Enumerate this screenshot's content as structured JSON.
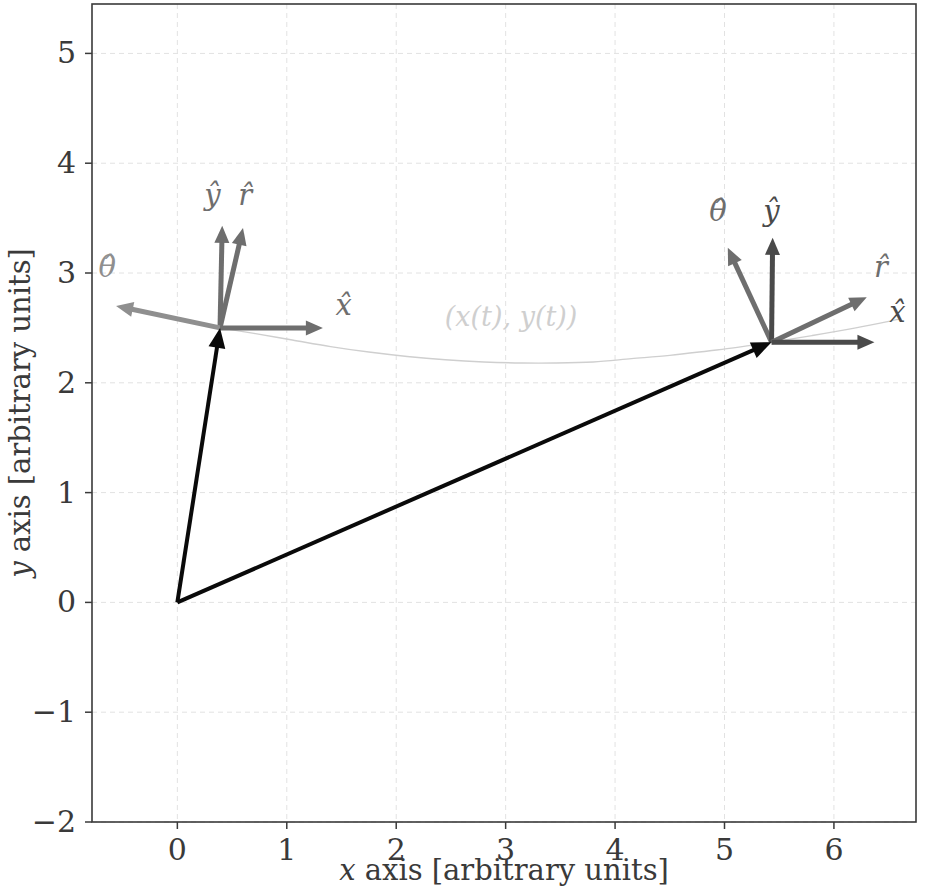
{
  "figure": {
    "background_color": "#ffffff",
    "frame_color": "#3a3a3a",
    "grid_color": "#e2e2e2",
    "tick_label_color": "#3a3a3a"
  },
  "axes": {
    "xlabel": "x axis [arbitrary units]",
    "xlabel_var": "x",
    "xlabel_rest": " axis [arbitrary units]",
    "ylabel": "y axis [arbitrary units]",
    "ylabel_var": "y",
    "ylabel_rest": " axis [arbitrary units]",
    "xlim": [
      -0.78,
      6.75
    ],
    "ylim": [
      -2.0,
      5.45
    ],
    "xticks": [
      0,
      1,
      2,
      3,
      4,
      5,
      6
    ],
    "xticklabels": [
      "0",
      "1",
      "2",
      "3",
      "4",
      "5",
      "6"
    ],
    "yticks": [
      -2,
      -1,
      0,
      1,
      2,
      3,
      4,
      5
    ],
    "yticklabels": [
      "−2",
      "−1",
      "0",
      "1",
      "2",
      "3",
      "4",
      "5"
    ],
    "grid": true
  },
  "chart_data": {
    "type": "scatter",
    "title": "",
    "xlabel": "x axis [arbitrary units]",
    "ylabel": "y axis [arbitrary units]",
    "xlim": [
      -0.78,
      6.75
    ],
    "ylim": [
      -2.0,
      5.45
    ],
    "grid": true,
    "legend": "none",
    "trajectory": {
      "name": "(x(t), y(t))",
      "label": "(x(t), y(t))",
      "label_x": 3.05,
      "label_y": 2.52,
      "color": "#cfcfcf",
      "linewidth": 1.4,
      "points": [
        [
          0.39,
          2.5
        ],
        [
          0.7,
          2.45
        ],
        [
          1.05,
          2.39
        ],
        [
          1.4,
          2.33
        ],
        [
          1.75,
          2.28
        ],
        [
          2.1,
          2.24
        ],
        [
          2.45,
          2.21
        ],
        [
          2.8,
          2.19
        ],
        [
          3.15,
          2.18
        ],
        [
          3.45,
          2.18
        ],
        [
          3.8,
          2.19
        ],
        [
          4.15,
          2.22
        ],
        [
          4.5,
          2.25
        ],
        [
          4.85,
          2.29
        ],
        [
          5.1,
          2.32
        ],
        [
          5.43,
          2.37
        ],
        [
          5.8,
          2.43
        ],
        [
          6.2,
          2.5
        ],
        [
          6.6,
          2.58
        ]
      ]
    },
    "position_vectors": [
      {
        "name": "position-vector-early",
        "from": [
          0.0,
          0.0
        ],
        "to": [
          0.39,
          2.5
        ],
        "color": "#0a0a0a",
        "linewidth": 4.0
      },
      {
        "name": "position-vector-late",
        "from": [
          0.0,
          0.0
        ],
        "to": [
          5.43,
          2.37
        ],
        "color": "#0a0a0a",
        "linewidth": 4.0
      }
    ],
    "basis_frames": [
      {
        "name": "frame-early",
        "origin": [
          0.39,
          2.5
        ],
        "vectors": [
          {
            "symbol": "ŷ",
            "name": "y-hat",
            "dx": 0.02,
            "dy": 0.93,
            "color": "#6e6e6e",
            "label_x": 0.32,
            "label_y": 3.62
          },
          {
            "symbol": "r̂",
            "name": "r-hat",
            "dx": 0.21,
            "dy": 0.91,
            "color": "#6e6e6e",
            "label_x": 0.62,
            "label_y": 3.62
          },
          {
            "symbol": "θ̂",
            "name": "theta-hat",
            "dx": -0.95,
            "dy": 0.2,
            "color": "#8f8f8f",
            "label_x": -0.64,
            "label_y": 2.96
          },
          {
            "symbol": "x̂",
            "name": "x-hat",
            "dx": 0.94,
            "dy": 0.0,
            "color": "#6e6e6e",
            "label_x": 1.52,
            "label_y": 2.62
          }
        ]
      },
      {
        "name": "frame-late",
        "origin": [
          5.43,
          2.37
        ],
        "vectors": [
          {
            "symbol": "θ̂",
            "name": "theta-hat",
            "dx": -0.4,
            "dy": 0.86,
            "color": "#6e6e6e",
            "label_x": 4.94,
            "label_y": 3.47
          },
          {
            "symbol": "ŷ",
            "name": "y-hat",
            "dx": 0.01,
            "dy": 0.95,
            "color": "#4a4a4a",
            "label_x": 5.43,
            "label_y": 3.47
          },
          {
            "symbol": "r̂",
            "name": "r-hat",
            "dx": 0.87,
            "dy": 0.41,
            "color": "#6e6e6e",
            "label_x": 6.43,
            "label_y": 2.96
          },
          {
            "symbol": "x̂",
            "name": "x-hat",
            "dx": 0.94,
            "dy": 0.0,
            "color": "#4a4a4a",
            "label_x": 6.58,
            "label_y": 2.55
          }
        ]
      }
    ]
  }
}
